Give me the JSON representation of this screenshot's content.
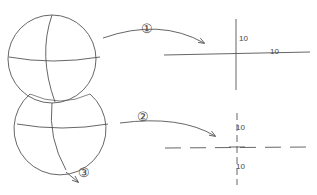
{
  "diagram": {
    "spheres": [
      {
        "name": "upper-sphere",
        "cx": 52,
        "cy": 59,
        "r": 45
      },
      {
        "name": "lower-sphere",
        "cx": 62,
        "cy": 126,
        "r": 46
      }
    ],
    "markers": [
      {
        "id": "1",
        "label": "①"
      },
      {
        "id": "2",
        "label": "②"
      },
      {
        "id": "3",
        "label": "③"
      }
    ],
    "cross_1": {
      "style": "solid",
      "labels": {
        "vertical": "10",
        "horizontal": "10"
      }
    },
    "cross_2": {
      "style": "dashed",
      "labels": {
        "top": "10",
        "bottom": "10"
      }
    },
    "colors": {
      "line": "#555555",
      "text": "#444444",
      "background": "#ffffff"
    }
  }
}
